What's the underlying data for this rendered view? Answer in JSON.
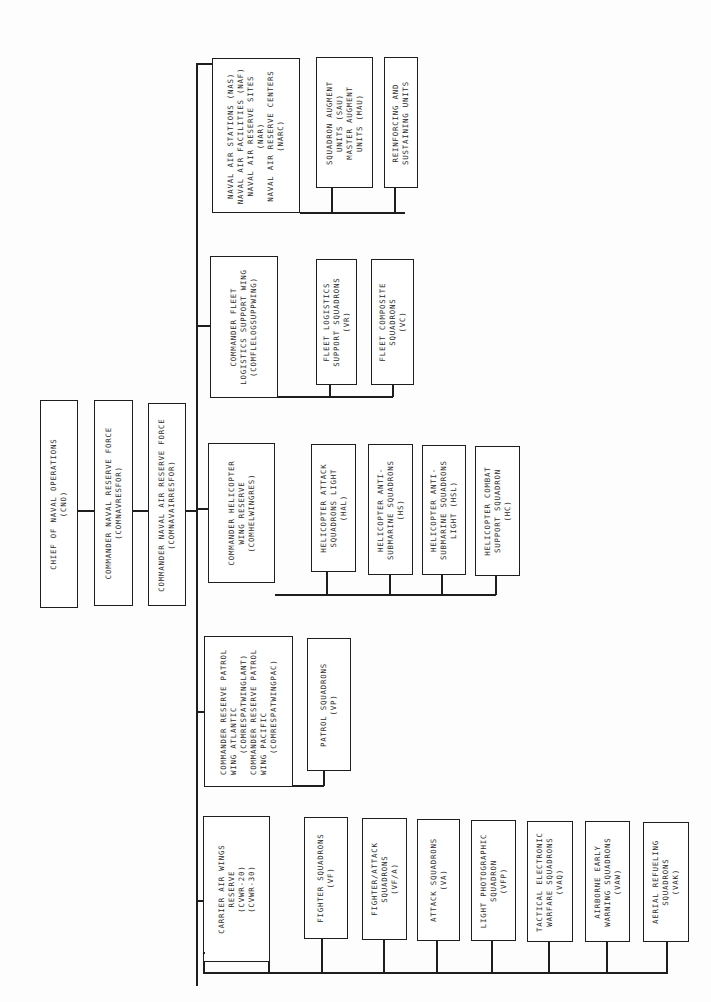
{
  "chart": {
    "orientation": "rotated 90 degrees counterclockwise",
    "top_chain": [
      {
        "id": "cno",
        "label": "CHIEF OF NAVAL OPERATIONS\n(CNO)"
      },
      {
        "id": "comnavresfor",
        "label": "COMMANDER NAVAL RESERVE FORCE\n(COMNAVRESFOR)"
      },
      {
        "id": "comnavairresfor",
        "label": "COMMANDER NAVAL AIR RESERVE FORCE\n(COMNAVAIRRESFOR)"
      }
    ],
    "branches": [
      {
        "id": "air-stations",
        "head": "NAVAL AIR STATIONS (NAS)\nNAVAL AIR FACILITIES (NAF)\nNAVAL AIR RESERVE SITES\n(NAR)\nNAVAL AIR RESERVE CENTERS\n(NARC)",
        "children": [
          "SQUADRON AUGMENT\nUNITS (SAU)\nMASTER AUGMENT\nUNITS (MAU)",
          "REINFORCING AND\nSUSTAINING UNITS"
        ]
      },
      {
        "id": "fleet-logistics",
        "head": "COMMANDER FLEET\nLOGISTICS SUPPORT WING\n(COMFLELOGSUPPWING)",
        "children": [
          "FLEET LOGISTICS\nSUPPORT SQUADRONS\n(VR)",
          "FLEET COMPOSITE\nSQUADRONS\n(VC)"
        ]
      },
      {
        "id": "helicopter-wing",
        "head": "COMMANDER HELICOPTER\nWING RESERVE\n(COMHELWINGRES)",
        "children": [
          "HELICOPTER ATTACK\nSQUADRONS LIGHT\n(HAL)",
          "HELICOPTER ANTI-\nSUBMARINE SQUADRONS\n(HS)",
          "HELICOPTER ANTI-\nSUBMARINE SQUADRONS\nLIGHT (HSL)",
          "HELICOPTER COMBAT\nSUPPORT SQUADRON\n(HC)"
        ]
      },
      {
        "id": "patrol-wing",
        "head": "COMMANDER RESERVE PATROL\nWING ATLANTIC\n    (COMRESPATWINGLANT)\nCOMMANDER RESERVE PATROL\nWING PACIFIC\n    (COMRESPATWINGPAC)",
        "children": [
          "PATROL SQUADRONS\n(VP)"
        ]
      },
      {
        "id": "carrier-air-wings",
        "head": "CARRIER AIR WINGS\nRESERVE\n(CVWR-20)\n(CVWR-30)",
        "children": [
          "FIGHTER SQUADRONS\n(VF)",
          "FIGHTER/ATTACK\nSQUADRONS\n(VF/A)",
          "ATTACK SQUADRONS\n(VA)",
          "LIGHT PHOTOGRAPHIC\nSQUADRON\n(VFP)",
          "TACTICAL ELECTRONIC\nWARFARE SQUADRONS\n(VAQ)",
          "AIRBORNE EARLY\nWARNING SQUADRONS\n(VAW)",
          "AERIAL REFUELING\nSQUADRONS\n(VAK)"
        ]
      }
    ]
  }
}
